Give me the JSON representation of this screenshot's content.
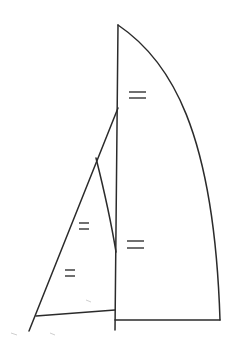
{
  "diagram": {
    "line_color": "#2b2b2b",
    "background": "#ffffff",
    "elements": [
      {
        "id": "mast",
        "label": ""
      },
      {
        "id": "mainsail-leech",
        "label": ""
      },
      {
        "id": "mainsail-foot",
        "label": ""
      },
      {
        "id": "forestay",
        "label": ""
      },
      {
        "id": "jib-leech",
        "label": ""
      },
      {
        "id": "jib-foot",
        "label": ""
      }
    ],
    "equal_marks": [
      {
        "location": "mast upper segment",
        "symbol": "="
      },
      {
        "location": "mast lower segment",
        "symbol": "="
      },
      {
        "location": "forestay upper segment",
        "symbol": "="
      },
      {
        "location": "forestay lower segment",
        "symbol": "="
      }
    ]
  }
}
